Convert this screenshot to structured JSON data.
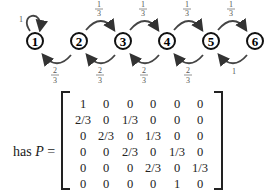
{
  "diagram": {
    "nodes": [
      "1",
      "2",
      "3",
      "4",
      "5",
      "6"
    ],
    "self_loop": {
      "node": "1",
      "label": "1"
    },
    "forward_edges": [
      {
        "from": "2",
        "to": "3",
        "num": "1",
        "den": "3"
      },
      {
        "from": "3",
        "to": "4",
        "num": "1",
        "den": "3"
      },
      {
        "from": "4",
        "to": "5",
        "num": "1",
        "den": "3"
      },
      {
        "from": "5",
        "to": "6",
        "num": "1",
        "den": "3"
      }
    ],
    "backward_edges": [
      {
        "from": "2",
        "to": "1",
        "num": "2",
        "den": "3"
      },
      {
        "from": "3",
        "to": "2",
        "num": "2",
        "den": "3"
      },
      {
        "from": "4",
        "to": "3",
        "num": "2",
        "den": "3"
      },
      {
        "from": "5",
        "to": "4",
        "num": "2",
        "den": "3"
      },
      {
        "from": "6",
        "to": "5",
        "label": "1"
      }
    ]
  },
  "equation": {
    "prefix": "has ",
    "symbol": "P",
    "equals": " =",
    "matrix": [
      [
        "1",
        "0",
        "0",
        "0",
        "0",
        "0"
      ],
      [
        "2/3",
        "0",
        "1/3",
        "0",
        "0",
        "0"
      ],
      [
        "0",
        "2/3",
        "0",
        "1/3",
        "0",
        "0"
      ],
      [
        "0",
        "0",
        "2/3",
        "0",
        "1/3",
        "0"
      ],
      [
        "0",
        "0",
        "0",
        "2/3",
        "0",
        "1/3"
      ],
      [
        "0",
        "0",
        "0",
        "0",
        "1",
        "0"
      ]
    ]
  }
}
